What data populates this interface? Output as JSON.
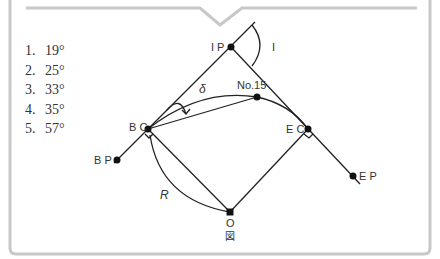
{
  "question": {
    "choices": [
      {
        "number": "1.",
        "value": "19°"
      },
      {
        "number": "2.",
        "value": "25°"
      },
      {
        "number": "3.",
        "value": "33°"
      },
      {
        "number": "4.",
        "value": "35°"
      },
      {
        "number": "5.",
        "value": "57°"
      }
    ]
  },
  "figure": {
    "caption": "図",
    "labels": {
      "ip": "I P",
      "i_angle": "I",
      "delta": "δ",
      "station": "No.15",
      "bc": "B C",
      "ec": "E C",
      "bp": "B P",
      "ep": "E P",
      "radius": "R",
      "center": "O"
    }
  },
  "colors": {
    "frame": "#c8c8c8",
    "line": "#222222",
    "text": "#333333"
  }
}
